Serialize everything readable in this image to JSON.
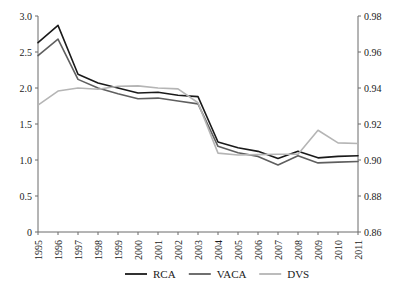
{
  "chart_data": {
    "type": "line",
    "title": "",
    "xlabel": "",
    "ylabel": "",
    "grid": false,
    "legend_position": "bottom",
    "x": [
      1995,
      1996,
      1997,
      1998,
      1999,
      2000,
      2001,
      2002,
      2003,
      2004,
      2005,
      2006,
      2007,
      2008,
      2009,
      2010,
      2011
    ],
    "categories": [
      "1995",
      "1996",
      "1997",
      "1998",
      "1999",
      "2000",
      "2001",
      "2002",
      "2003",
      "2004",
      "2005",
      "2006",
      "2007",
      "2008",
      "2009",
      "2010",
      "2011"
    ],
    "left_axis": {
      "ylim": [
        0,
        3.0
      ],
      "ticks": [
        0,
        0.5,
        1.0,
        1.5,
        2.0,
        2.5,
        3.0
      ],
      "tick_labels": [
        "0",
        "0.5",
        "1.0",
        "1.5",
        "2.0",
        "2.5",
        "3.0"
      ]
    },
    "right_axis": {
      "ylim": [
        0.86,
        0.98
      ],
      "ticks": [
        0.86,
        0.88,
        0.9,
        0.92,
        0.94,
        0.96,
        0.98
      ],
      "tick_labels": [
        "0.86",
        "0.88",
        "0.90",
        "0.92",
        "0.94",
        "0.96",
        "0.98"
      ]
    },
    "series": [
      {
        "name": "RCA",
        "axis": "left",
        "color": "#1a1a1a",
        "values": [
          2.63,
          2.87,
          2.19,
          2.07,
          2.0,
          1.93,
          1.94,
          1.9,
          1.88,
          1.25,
          1.17,
          1.12,
          1.02,
          1.12,
          1.03,
          1.05,
          1.06
        ]
      },
      {
        "name": "VACA",
        "axis": "left",
        "color": "#5f5f5f",
        "values": [
          2.45,
          2.68,
          2.12,
          2.0,
          1.92,
          1.85,
          1.86,
          1.82,
          1.78,
          1.19,
          1.1,
          1.05,
          0.93,
          1.06,
          0.96,
          0.97,
          0.98
        ]
      },
      {
        "name": "DVS",
        "axis": "right",
        "color": "#b5b5b5",
        "values": [
          0.9305,
          0.9383,
          0.94,
          0.9393,
          0.941,
          0.9412,
          0.94,
          0.9395,
          0.9318,
          0.9038,
          0.9028,
          0.903,
          0.9032,
          0.9032,
          0.9165,
          0.9095,
          0.9092
        ]
      }
    ]
  },
  "legend": {
    "items": [
      {
        "label": "RCA",
        "color": "#1a1a1a"
      },
      {
        "label": "VACA",
        "color": "#5f5f5f"
      },
      {
        "label": "DVS",
        "color": "#b5b5b5"
      }
    ]
  }
}
